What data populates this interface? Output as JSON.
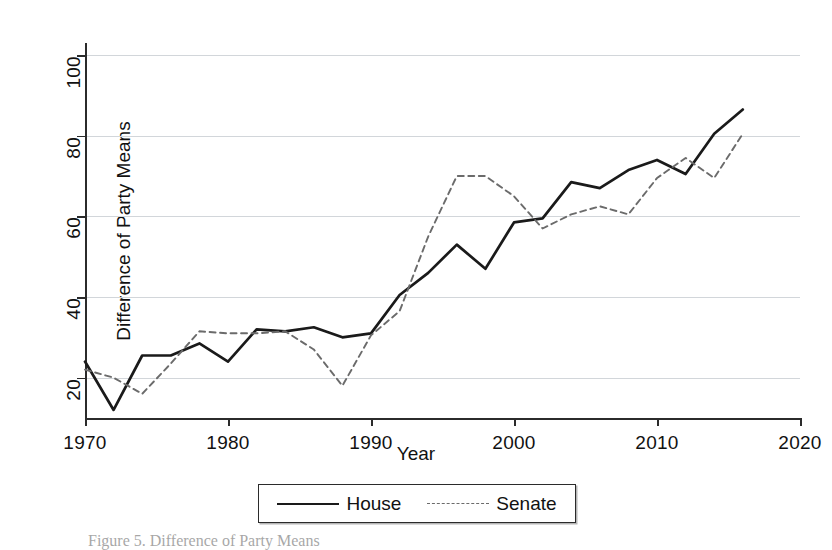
{
  "figure": {
    "caption": "Figure 5. Difference of Party Means"
  },
  "axes": {
    "x_title": "Year",
    "y_title": "Difference of Party Means",
    "x_ticks": [
      "1970",
      "1980",
      "1990",
      "2000",
      "2010",
      "2020"
    ],
    "y_ticks": [
      "20",
      "40",
      "60",
      "80",
      "100"
    ]
  },
  "legend": {
    "items": [
      {
        "label": "House",
        "style": "solid",
        "color": "#1a1a1a"
      },
      {
        "label": "Senate",
        "style": "dashed",
        "color": "#6b6b6b"
      }
    ]
  },
  "chart_data": {
    "type": "line",
    "title": "",
    "subtitle": "",
    "xlabel": "Year",
    "ylabel": "Difference of Party Means",
    "xlim": [
      1970,
      2020
    ],
    "ylim": [
      10,
      103
    ],
    "grid": true,
    "gridlines_y": [
      20,
      40,
      60,
      80,
      100
    ],
    "legend_position": "bottom",
    "x": [
      1970,
      1972,
      1974,
      1976,
      1978,
      1980,
      1982,
      1984,
      1986,
      1988,
      1990,
      1992,
      1994,
      1996,
      1998,
      2000,
      2002,
      2004,
      2006,
      2008,
      2010,
      2012,
      2014,
      2016
    ],
    "series": [
      {
        "name": "House",
        "style": "solid",
        "color": "#1a1a1a",
        "values": [
          24,
          12,
          25.5,
          25.5,
          28.5,
          24,
          32,
          31.5,
          32.5,
          30,
          31,
          40.5,
          46,
          53,
          47,
          58.5,
          59.5,
          68.5,
          67,
          71.5,
          74,
          70.5,
          80.5,
          86.5
        ]
      },
      {
        "name": "Senate",
        "style": "dashed",
        "color": "#6b6b6b",
        "values": [
          22,
          20,
          16,
          23.5,
          31.5,
          31,
          31,
          31.5,
          27,
          18,
          30.5,
          36.5,
          55,
          70,
          70,
          65,
          57,
          60.5,
          62.5,
          60.5,
          69.5,
          74.5,
          69.5,
          80.5
        ]
      }
    ]
  }
}
